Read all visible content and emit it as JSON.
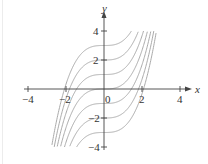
{
  "chart_data": {
    "type": "line",
    "title": "",
    "xlabel": "x",
    "ylabel": "y",
    "xlim": [
      -4,
      4
    ],
    "ylim": [
      -4,
      4
    ],
    "x_ticks": [
      "-4",
      "-2",
      "0",
      "2",
      "4"
    ],
    "y_ticks": [
      "4",
      "2",
      "-2",
      "-4"
    ],
    "grid": false,
    "legend": null,
    "series": [
      {
        "name": "C=3",
        "C": 3
      },
      {
        "name": "C=2",
        "C": 2
      },
      {
        "name": "C=1",
        "C": 1
      },
      {
        "name": "C=0",
        "C": 0
      },
      {
        "name": "C=-1",
        "C": -1
      },
      {
        "name": "C=-2",
        "C": -2
      },
      {
        "name": "C=-3",
        "C": -3
      }
    ],
    "curve_color": "#aaaaaa",
    "axis_color": "#444444"
  },
  "labels": {
    "x_axis": "x",
    "y_axis": "y",
    "xt_m4": "−4",
    "xt_m2": "−2",
    "xt_0": "0",
    "xt_2": "2",
    "xt_4": "4",
    "yt_4": "4",
    "yt_2": "2",
    "yt_m2": "−2",
    "yt_m4": "−4"
  }
}
